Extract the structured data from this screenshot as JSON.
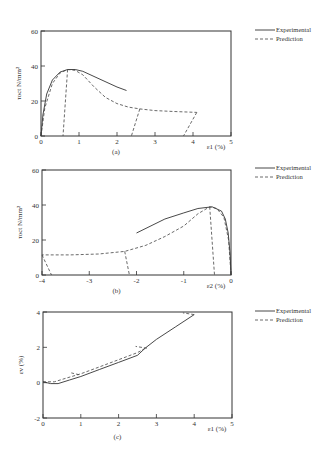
{
  "legend": {
    "experimental": "Experimental",
    "prediction": "Prediction"
  },
  "chart_data": [
    {
      "type": "line",
      "caption": "(a)",
      "xlabel": "ε1 (%)",
      "ylabel": "τoct N/mm²",
      "xlim": [
        0,
        5
      ],
      "ylim": [
        0,
        60
      ],
      "xticks": [
        0,
        1,
        2,
        3,
        4,
        5
      ],
      "yticks": [
        0,
        20,
        40,
        60
      ],
      "series": [
        {
          "name": "Experimental",
          "x": [
            0,
            0.05,
            0.15,
            0.3,
            0.5,
            0.7,
            0.9,
            1.1,
            1.5,
            2.0,
            2.25
          ],
          "y": [
            0,
            12,
            24,
            32,
            36.5,
            38,
            38,
            37,
            33,
            28,
            26
          ]
        },
        {
          "name": "Prediction",
          "x": [
            0,
            0.1,
            0.3,
            0.5,
            0.7,
            0.9,
            1.1,
            1.4,
            1.7,
            2.0,
            2.3,
            2.6,
            3.0,
            3.5,
            4.1
          ],
          "y": [
            0,
            16,
            30,
            36,
            38,
            37.5,
            35,
            28,
            22,
            18.5,
            16.5,
            15.5,
            14.5,
            14,
            13.5
          ]
        },
        {
          "name": "Prediction-unload-1",
          "x": [
            0.7,
            0.58
          ],
          "y": [
            38,
            0
          ]
        },
        {
          "name": "Prediction-unload-2",
          "x": [
            2.6,
            2.38
          ],
          "y": [
            15.5,
            0
          ]
        },
        {
          "name": "Prediction-unload-3",
          "x": [
            4.1,
            3.75
          ],
          "y": [
            13.5,
            0
          ]
        }
      ]
    },
    {
      "type": "line",
      "caption": "(b)",
      "xlabel": "ε2 (%)",
      "ylabel": "τoct N/mm²",
      "xlim": [
        -4,
        0
      ],
      "ylim": [
        0,
        60
      ],
      "xticks": [
        -4,
        -3,
        -2,
        -1,
        0
      ],
      "yticks": [
        0,
        20,
        40,
        60
      ],
      "series": [
        {
          "name": "Experimental",
          "x": [
            0,
            -0.02,
            -0.06,
            -0.12,
            -0.2,
            -0.4,
            -0.7,
            -1.0,
            -1.4,
            -2.0
          ],
          "y": [
            0,
            12,
            24,
            32,
            36.5,
            39,
            38,
            35.5,
            32,
            24
          ]
        },
        {
          "name": "Prediction",
          "x": [
            0,
            -0.05,
            -0.15,
            -0.3,
            -0.45,
            -0.7,
            -1.0,
            -1.4,
            -1.8,
            -2.25,
            -2.8,
            -3.4,
            -4.0
          ],
          "y": [
            0,
            20,
            33,
            38,
            39,
            35,
            28,
            22,
            17,
            13.5,
            12,
            11.5,
            11.5
          ]
        },
        {
          "name": "Prediction-unload-1",
          "x": [
            -0.45,
            -0.35
          ],
          "y": [
            39,
            0
          ]
        },
        {
          "name": "Prediction-unload-2",
          "x": [
            -2.25,
            -2.15
          ],
          "y": [
            13.5,
            0
          ]
        },
        {
          "name": "Prediction-unload-3",
          "x": [
            -4.0,
            -3.8
          ],
          "y": [
            11.5,
            0
          ]
        }
      ]
    },
    {
      "type": "line",
      "caption": "(c)",
      "xlabel": "ε1 (%)",
      "ylabel": "εv (%)",
      "xlim": [
        0,
        5
      ],
      "ylim": [
        -2,
        4
      ],
      "xticks": [
        0,
        1,
        2,
        3,
        4,
        5
      ],
      "yticks": [
        -2,
        0,
        2,
        4
      ],
      "series": [
        {
          "name": "Experimental",
          "x": [
            0,
            0.2,
            0.4,
            0.7,
            1.0,
            1.5,
            2.0,
            2.5,
            2.7,
            3.0,
            3.5,
            4.0
          ],
          "y": [
            0.05,
            -0.05,
            -0.05,
            0.15,
            0.35,
            0.75,
            1.15,
            1.55,
            1.95,
            2.45,
            3.15,
            3.85
          ]
        },
        {
          "name": "Prediction",
          "x": [
            0,
            0.3,
            0.6,
            1.0,
            1.5,
            2.0,
            2.5,
            2.75
          ],
          "y": [
            0.05,
            0.05,
            0.25,
            0.5,
            0.9,
            1.3,
            1.7,
            2.0
          ]
        },
        {
          "name": "Prediction-unload-1",
          "x": [
            0.95,
            0.75
          ],
          "y": [
            0.45,
            0.55
          ]
        },
        {
          "name": "Prediction-unload-2",
          "x": [
            2.75,
            2.45
          ],
          "y": [
            1.95,
            2.05
          ]
        },
        {
          "name": "Prediction-unload-3",
          "x": [
            4.0,
            3.7
          ],
          "y": [
            3.85,
            3.95
          ]
        }
      ]
    }
  ]
}
